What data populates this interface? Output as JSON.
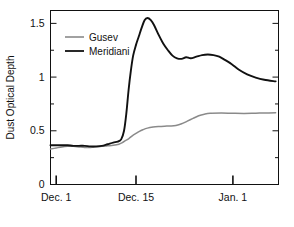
{
  "chart_data": {
    "type": "line",
    "title": "",
    "xlabel": "",
    "ylabel": "Dust Optical Depth",
    "xlim": [
      0,
      40
    ],
    "ylim": [
      0,
      1.62
    ],
    "grid": false,
    "legend_position": "upper-left",
    "x_tick_labels": [
      "Dec. 1",
      "Dec. 15",
      "Jan. 1"
    ],
    "x_tick_values": [
      1,
      15,
      32
    ],
    "y_tick_labels": [
      "0",
      "0.5",
      "1",
      "1.5"
    ],
    "y_tick_values": [
      0,
      0.5,
      1,
      1.5
    ],
    "y_minor_tick_values": [
      0.25,
      0.75,
      1.25
    ],
    "series": [
      {
        "name": "Gusev",
        "color": "#8a8a8a",
        "x": [
          0.0,
          1.0,
          2.0,
          3.0,
          4.0,
          5.0,
          6.0,
          7.0,
          8.0,
          9.0,
          10.0,
          11.0,
          12.0,
          12.6,
          13.2,
          13.8,
          14.4,
          15.0,
          15.6,
          16.2,
          17.0,
          18.0,
          19.0,
          20.0,
          21.0,
          22.0,
          23.0,
          24.0,
          25.0,
          26.0,
          27.0,
          28.0,
          30.0,
          32.0,
          34.0,
          36.0,
          38.0,
          39.5
        ],
        "values": [
          0.33,
          0.34,
          0.35,
          0.355,
          0.355,
          0.35,
          0.345,
          0.345,
          0.35,
          0.355,
          0.36,
          0.365,
          0.375,
          0.39,
          0.41,
          0.43,
          0.455,
          0.475,
          0.495,
          0.51,
          0.525,
          0.535,
          0.54,
          0.543,
          0.545,
          0.55,
          0.565,
          0.59,
          0.615,
          0.64,
          0.655,
          0.663,
          0.665,
          0.663,
          0.662,
          0.664,
          0.666,
          0.667
        ]
      },
      {
        "name": "Meridiani",
        "color": "#111111",
        "x": [
          0.0,
          1.0,
          2.0,
          3.0,
          4.0,
          5.0,
          6.0,
          7.0,
          8.0,
          9.0,
          10.0,
          11.0,
          11.8,
          12.4,
          12.9,
          13.3,
          13.7,
          14.1,
          14.5,
          15.0,
          15.5,
          16.0,
          16.5,
          17.0,
          17.6,
          18.2,
          19.0,
          19.8,
          20.6,
          21.4,
          22.2,
          23.0,
          23.8,
          24.6,
          25.6,
          26.6,
          27.6,
          28.6,
          29.6,
          30.6,
          31.8,
          33.0,
          34.5,
          36.0,
          37.5,
          39.5
        ],
        "values": [
          0.365,
          0.365,
          0.365,
          0.365,
          0.36,
          0.36,
          0.36,
          0.355,
          0.355,
          0.36,
          0.375,
          0.39,
          0.4,
          0.42,
          0.5,
          0.66,
          0.88,
          1.06,
          1.2,
          1.3,
          1.38,
          1.46,
          1.53,
          1.55,
          1.53,
          1.48,
          1.39,
          1.31,
          1.25,
          1.2,
          1.175,
          1.17,
          1.185,
          1.175,
          1.19,
          1.205,
          1.21,
          1.205,
          1.19,
          1.16,
          1.12,
          1.07,
          1.025,
          0.995,
          0.975,
          0.96
        ]
      }
    ]
  },
  "legend": {
    "entries": [
      {
        "label": "Gusev",
        "color": "#8a8a8a"
      },
      {
        "label": "Meridiani",
        "color": "#111111"
      }
    ]
  },
  "axes": {
    "y_title": "Dust Optical Depth",
    "y_labels": {
      "t0": "0",
      "t1": "0.5",
      "t2": "1",
      "t3": "1.5"
    },
    "x_labels": {
      "t0": "Dec. 1",
      "t1": "Dec. 15",
      "t2": "Jan. 1"
    }
  },
  "colors": {
    "axis": "#111111",
    "gusev": "#8a8a8a",
    "meridiani": "#111111",
    "background": "#ffffff"
  }
}
